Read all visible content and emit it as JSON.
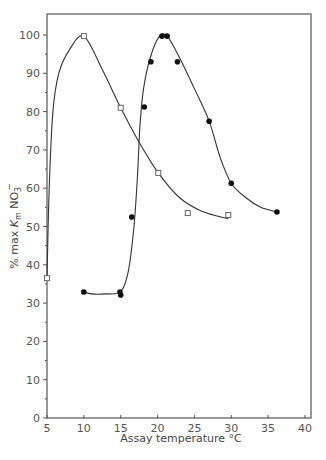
{
  "chart_data": {
    "type": "scatter",
    "title": "",
    "xlabel": "Assay temperature °C",
    "ylabel": "% max Km NO3−",
    "ylabel_parts": {
      "pre": "% max ",
      "k": "K",
      "m": "m",
      "no": " NO",
      "sub": "3",
      "sup": "−"
    },
    "xlim": [
      5,
      40.8
    ],
    "ylim": [
      0,
      105
    ],
    "xticks": [
      5,
      10,
      15,
      20,
      25,
      30,
      35,
      40
    ],
    "yticks": [
      0,
      10,
      20,
      30,
      40,
      50,
      60,
      70,
      80,
      90,
      100
    ],
    "y_minor_step": 5,
    "grid": false,
    "legend": null,
    "series": [
      {
        "name": "open squares",
        "marker": "open-square",
        "points": [
          {
            "x": 5.0,
            "y": 36.5
          },
          {
            "x": 10.0,
            "y": 99.7
          },
          {
            "x": 15.0,
            "y": 81.0
          },
          {
            "x": 20.1,
            "y": 64.0
          },
          {
            "x": 24.1,
            "y": 53.5
          },
          {
            "x": 29.6,
            "y": 53.0
          }
        ],
        "curve": [
          [
            5.0,
            36.5
          ],
          [
            5.3,
            60
          ],
          [
            5.8,
            80
          ],
          [
            6.6,
            90
          ],
          [
            8.0,
            96
          ],
          [
            10.0,
            99.7
          ],
          [
            12.5,
            91
          ],
          [
            15.0,
            81
          ],
          [
            17.5,
            72
          ],
          [
            20.1,
            64
          ],
          [
            23,
            57.5
          ],
          [
            26,
            54
          ],
          [
            29.6,
            52
          ]
        ]
      },
      {
        "name": "filled circles",
        "marker": "filled-circle",
        "points": [
          {
            "x": 10.0,
            "y": 32.9
          },
          {
            "x": 14.9,
            "y": 32.9
          },
          {
            "x": 15.0,
            "y": 32.1
          },
          {
            "x": 16.5,
            "y": 52.5
          },
          {
            "x": 18.2,
            "y": 81.2
          },
          {
            "x": 19.1,
            "y": 93.0
          },
          {
            "x": 20.6,
            "y": 99.7
          },
          {
            "x": 21.3,
            "y": 99.7
          },
          {
            "x": 22.7,
            "y": 93.0
          },
          {
            "x": 27.0,
            "y": 77.5
          },
          {
            "x": 30.0,
            "y": 61.3
          },
          {
            "x": 36.2,
            "y": 53.8
          }
        ],
        "curve": [
          [
            9.6,
            33.2
          ],
          [
            11,
            32.4
          ],
          [
            13,
            32.4
          ],
          [
            15.0,
            33
          ],
          [
            16.0,
            38
          ],
          [
            16.8,
            50
          ],
          [
            17.3,
            64
          ],
          [
            17.6,
            76
          ],
          [
            18.1,
            86
          ],
          [
            19.0,
            94
          ],
          [
            20.2,
            99.5
          ],
          [
            21.3,
            99.7
          ],
          [
            23,
            94
          ],
          [
            25,
            86
          ],
          [
            27,
            77.5
          ],
          [
            28.5,
            68
          ],
          [
            30,
            61.3
          ],
          [
            32,
            57.5
          ],
          [
            34,
            55
          ],
          [
            36.2,
            53.8
          ]
        ]
      }
    ]
  }
}
